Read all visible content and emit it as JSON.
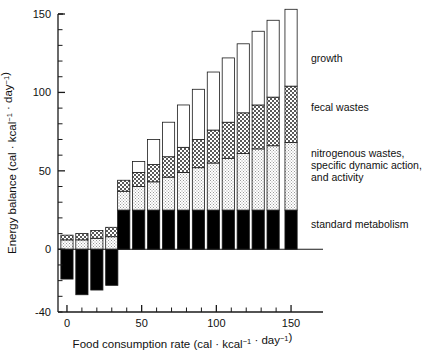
{
  "chart_data": {
    "type": "bar",
    "stacked": true,
    "title": "",
    "subtitle": "",
    "xlabel": "Food consumption rate  (cal · kcal⁻¹ · day⁻¹)",
    "ylabel": "Energy balance (cal · kcal⁻¹ · day⁻¹)",
    "xlim": [
      -6,
      158
    ],
    "ylim": [
      -40,
      150
    ],
    "xticks": [
      0,
      50,
      100,
      150
    ],
    "xticklabels": [
      "0",
      "50",
      "100",
      "150"
    ],
    "xminortick_step": 10,
    "yticks": [
      0,
      50,
      100,
      150
    ],
    "yticklabels": [
      "0",
      "50",
      "100",
      "150"
    ],
    "ybottom_tick_label": "-40",
    "yminortick_step": 10,
    "grid": false,
    "legend_position": "right-inline-annotations",
    "zero_line": 0,
    "categories": [
      0,
      10,
      20,
      30,
      38,
      48,
      58,
      68,
      78,
      88,
      98,
      108,
      118,
      128,
      138,
      150
    ],
    "series": [
      {
        "name": "standard metabolism",
        "fill": "black",
        "values": [
          -19,
          -29,
          -26,
          -23,
          25,
          25,
          25,
          25,
          25,
          25,
          25,
          25,
          25,
          25,
          25,
          25
        ]
      },
      {
        "name": "nitrogenous wastes, specific dynamic action, and activity",
        "fill": "light-stipple",
        "values": [
          6,
          6,
          7,
          8,
          12,
          15,
          18,
          21,
          24,
          27,
          30,
          33,
          36,
          39,
          41,
          43
        ]
      },
      {
        "name": "fecal wastes",
        "fill": "checker",
        "values": [
          3,
          4,
          5,
          6,
          7,
          9,
          11,
          13,
          16,
          18,
          21,
          23,
          26,
          28,
          31,
          36
        ]
      },
      {
        "name": "growth",
        "fill": "white",
        "values": [
          0,
          0,
          0,
          0,
          0,
          7,
          16,
          22,
          27,
          32,
          37,
          41,
          44,
          47,
          49,
          49
        ]
      }
    ],
    "annotations": [
      {
        "label": "growth",
        "x": 311,
        "y": 62
      },
      {
        "label": "fecal wastes",
        "x": 311,
        "y": 111
      },
      {
        "label": "nitrogenous wastes,",
        "x": 311,
        "y": 157
      },
      {
        "label": "specific dynamic action,",
        "x": 311,
        "y": 169
      },
      {
        "label": "and activity",
        "x": 311,
        "y": 181
      },
      {
        "label": "standard metabolism",
        "x": 311,
        "y": 228
      }
    ]
  },
  "colors": {
    "axis": "#1a1a1a",
    "standard_metabolism": "#000000",
    "nitrogenous_wastes": "#d9d9d9",
    "fecal_wastes": "#b5b5b5",
    "growth": "#ffffff",
    "background": "#ffffff"
  }
}
